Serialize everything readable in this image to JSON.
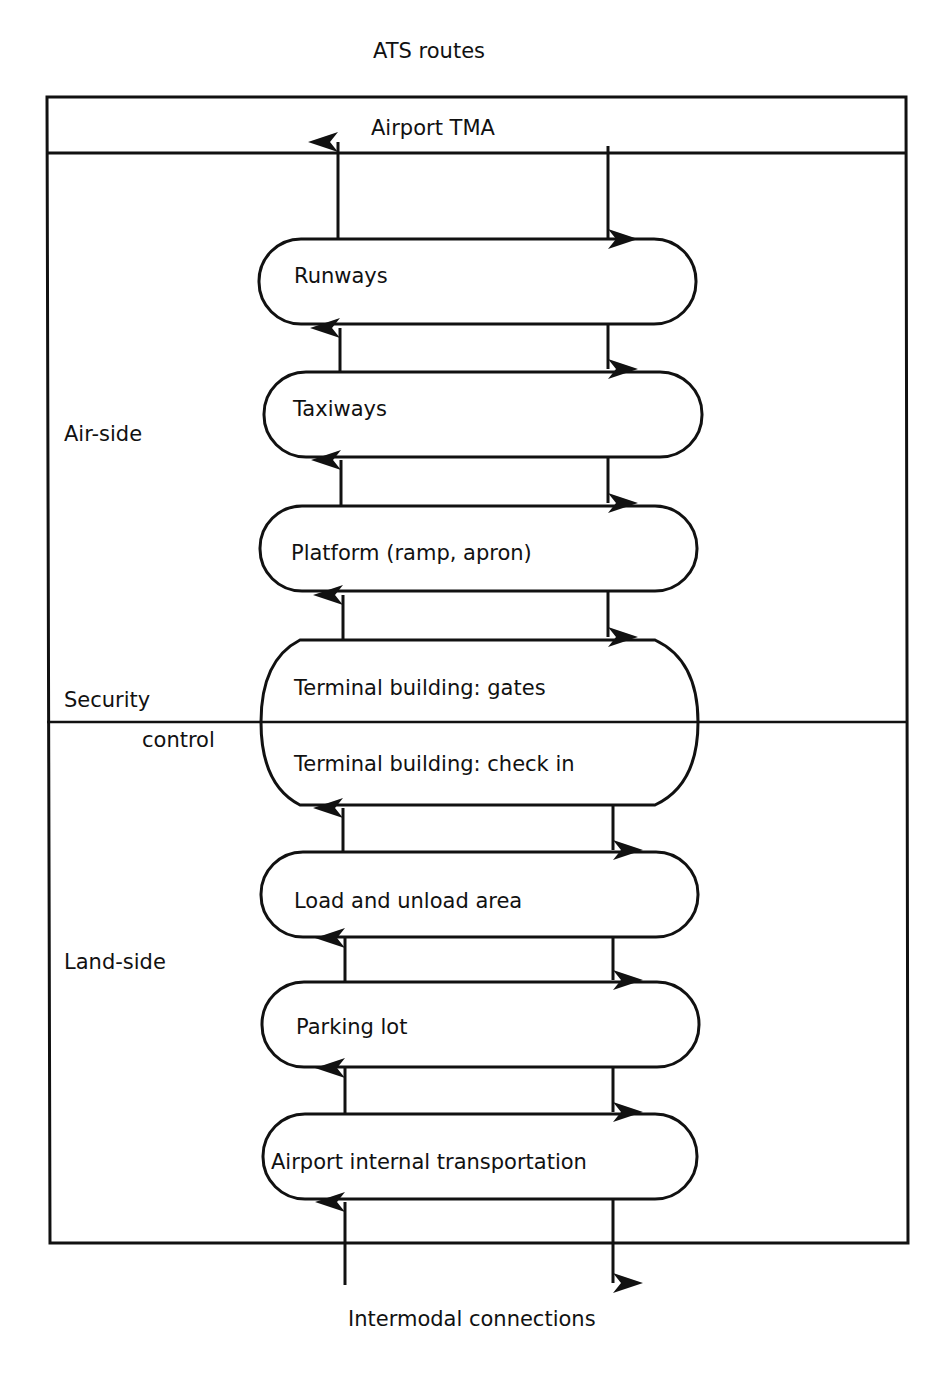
{
  "diagram": {
    "top_label": "ATS routes",
    "tma_label": "Airport TMA",
    "bottom_label": "Intermodal connections",
    "zone_labels": {
      "air_side": "Air-side",
      "security": "Security",
      "control": "control",
      "land_side": "Land-side"
    },
    "nodes": [
      {
        "id": "runways",
        "label": "Runways"
      },
      {
        "id": "taxiways",
        "label": "Taxiways"
      },
      {
        "id": "platform",
        "label": "Platform (ramp, apron)"
      },
      {
        "id": "terminal",
        "label_top": "Terminal building: gates",
        "label_bottom": "Terminal building: check in"
      },
      {
        "id": "load",
        "label": "Load and unload area"
      },
      {
        "id": "parking",
        "label": "Parking lot"
      },
      {
        "id": "transport",
        "label": "Airport internal transportation"
      }
    ],
    "flows": {
      "up": "departures flow upward (left arrows)",
      "down": "arrivals flow downward (right arrows)"
    },
    "colors": {
      "stroke": "#111111",
      "background": "#ffffff"
    }
  }
}
